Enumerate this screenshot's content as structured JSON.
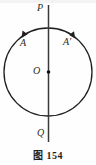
{
  "figure": {
    "caption_label": "图",
    "caption_number": "154",
    "caption_full": "图 154",
    "background_color": "#fefefe",
    "stroke_color": "#1f1f1f",
    "labels": {
      "top_point": "P",
      "bottom_point": "Q",
      "center_point": "O",
      "left_arc": "A",
      "right_arc": "A'"
    },
    "geometry": {
      "circle_center_x": 48,
      "circle_center_y": 72,
      "circle_radius": 44,
      "axis_x": 48,
      "axis_top_y": 5,
      "axis_bottom_y": 142,
      "center_dot_radius": 1.7,
      "left_arrow_label": "arc-arrow-left",
      "right_arrow_label": "arc-arrow-right"
    }
  }
}
